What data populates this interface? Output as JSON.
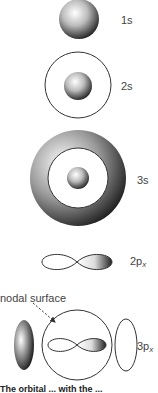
{
  "figure": {
    "orbitals": [
      {
        "id": "1s",
        "label": "1s",
        "main": "1",
        "sub": ""
      },
      {
        "id": "2s",
        "label": "2s",
        "main": "2s",
        "sub": ""
      },
      {
        "id": "3s",
        "label": "3s",
        "main": "3s",
        "sub": ""
      },
      {
        "id": "2px",
        "label": "2px",
        "main": "2p",
        "sub": "x"
      },
      {
        "id": "3px",
        "label": "3px",
        "main": "3p",
        "sub": "x"
      }
    ],
    "annotation": "nodal surface",
    "caption": "The orbital... with the..."
  },
  "labels": {
    "l1s": "1s",
    "l2s": "2s",
    "l3s": "3s",
    "l2p_main": "2p",
    "l2p_sub": "x",
    "l3p_main": "3p",
    "l3p_sub": "x",
    "nodal": "nodal surface",
    "caption": "The orbital ... with the ..."
  }
}
